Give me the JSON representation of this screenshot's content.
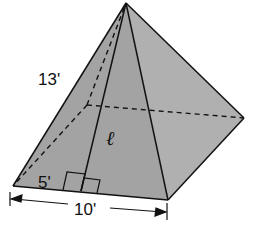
{
  "diagram": {
    "type": "square-pyramid",
    "fill_color": "#a6a6a6",
    "line_color": "#111111",
    "labels": {
      "lateral_edge": "13'",
      "slant_height": "ℓ",
      "half_base": "5'",
      "base_edge": "10'"
    }
  }
}
